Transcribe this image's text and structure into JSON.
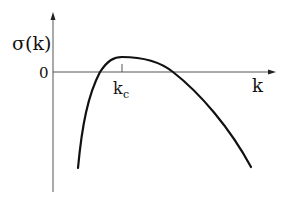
{
  "diagram": {
    "ylabel": "σ(k)",
    "xlabel": "k",
    "zero_label": "0",
    "critical_label_main": "k",
    "critical_label_sub": "c",
    "line_color": "#111111",
    "axis_color": "#555555"
  }
}
